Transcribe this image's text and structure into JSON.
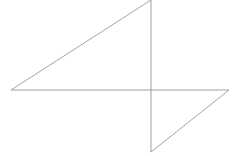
{
  "canvas": {
    "width": 240,
    "height": 156,
    "background": "#ffffff",
    "title": "Geometric line figure"
  },
  "style": {
    "stroke_color": "#8c8c8c",
    "stroke_color_strong": "#808080",
    "stroke_width": 0.8
  },
  "figure": {
    "vertices": [
      {
        "name": "left-vertex",
        "x": 11,
        "y": 90
      },
      {
        "name": "top-vertex",
        "x": 151,
        "y": 0
      },
      {
        "name": "center-vertex",
        "x": 151,
        "y": 90
      },
      {
        "name": "bottom-vertex",
        "x": 151,
        "y": 152
      },
      {
        "name": "right-vertex",
        "x": 229,
        "y": 90
      }
    ],
    "segments": [
      {
        "name": "horizontal-baseline",
        "x1": 11,
        "y1": 90,
        "x2": 229,
        "y2": 90,
        "color": "#8c8c8c",
        "width": 0.8
      },
      {
        "name": "vertical-axis",
        "x1": 151,
        "y1": 0,
        "x2": 151,
        "y2": 152,
        "color": "#8c8c8c",
        "width": 0.8
      },
      {
        "name": "upper-left-hypotenuse",
        "x1": 11,
        "y1": 90,
        "x2": 151,
        "y2": 0,
        "color": "#8c8c8c",
        "width": 0.8
      },
      {
        "name": "lower-right-hypotenuse",
        "x1": 151,
        "y1": 152,
        "x2": 229,
        "y2": 90,
        "color": "#8c8c8c",
        "width": 0.8
      }
    ]
  },
  "chart_data": {
    "type": "line",
    "title": "",
    "xlabel": "",
    "ylabel": "",
    "grid": false,
    "legend": "none",
    "xlim": [
      0,
      240
    ],
    "ylim": [
      156,
      0
    ],
    "series": [
      {
        "name": "horizontal-baseline",
        "x": [
          11,
          229
        ],
        "y": [
          90,
          90
        ]
      },
      {
        "name": "vertical-axis",
        "x": [
          151,
          151
        ],
        "y": [
          0,
          152
        ]
      },
      {
        "name": "upper-left-hypotenuse",
        "x": [
          11,
          151
        ],
        "y": [
          90,
          0
        ]
      },
      {
        "name": "lower-right-hypotenuse",
        "x": [
          151,
          229
        ],
        "y": [
          152,
          90
        ]
      }
    ]
  }
}
